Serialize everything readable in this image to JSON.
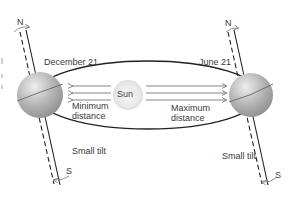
{
  "diagram": {
    "labels": {
      "december": "December 21",
      "june": "June 21",
      "sun": "Sun",
      "min_distance_line1": "Minimum",
      "min_distance_line2": "distance",
      "max_distance_line1": "Maximum",
      "max_distance_line2": "distance",
      "small_tilt_left": "Small tilt",
      "small_tilt_right": "Small tilt",
      "north_left": "N",
      "south_left": "S",
      "north_right": "N",
      "south_right": "S"
    },
    "colors": {
      "globe": "#a8a8a8",
      "globe_highlight": "#e6e6e6",
      "sun": "#ececec",
      "orbit": "#222222",
      "arrows": "#777777",
      "text": "#3a3a3a"
    }
  }
}
